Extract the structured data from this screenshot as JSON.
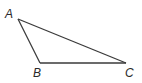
{
  "diagram": {
    "type": "triangle",
    "vertices": [
      {
        "label": "A",
        "x": 18,
        "y": 19
      },
      {
        "label": "B",
        "x": 40,
        "y": 63
      },
      {
        "label": "C",
        "x": 126,
        "y": 63
      }
    ],
    "edges": [
      [
        "A",
        "B"
      ],
      [
        "B",
        "C"
      ],
      [
        "C",
        "A"
      ]
    ],
    "colors": {
      "stroke": "#3a3a3a",
      "label": "#2a2a2a",
      "background": "#ffffff"
    }
  }
}
